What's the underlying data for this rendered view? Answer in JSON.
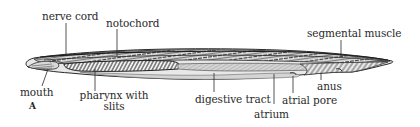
{
  "figure": {
    "panel_letter": "A",
    "labels": {
      "nerve_cord": "nerve cord",
      "notochord": "notochord",
      "segmental_muscle": "segmental muscle",
      "mouth": "mouth",
      "pharynx_line1": "pharynx with",
      "pharynx_line2": "slits",
      "digestive_tract": "digestive tract",
      "atrium": "atrium",
      "atrial_pore": "atrial pore",
      "anus": "anus"
    },
    "colors": {
      "ink": "#2a2a2a",
      "body_fill": "#e4e4e4",
      "atrium_fill": "#d6d6d6",
      "background": "#ffffff"
    }
  }
}
